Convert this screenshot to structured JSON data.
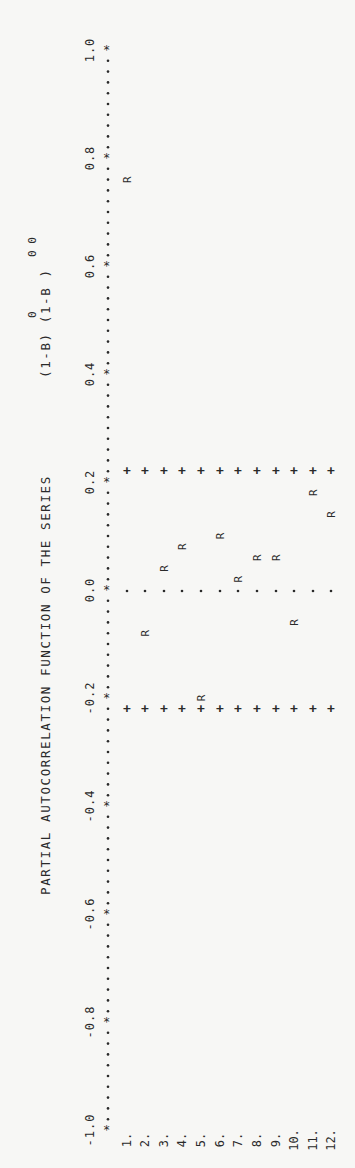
{
  "title": {
    "text": "PARTIAL AUTOCORRELATION FUNCTION OF THE SERIES",
    "formula": "(1-B) (1-B )",
    "superscript_first": "0",
    "superscript_second": "0 0"
  },
  "chart_data": {
    "type": "bar",
    "orientation": "rotated-90 (value axis vertical, reading bottom-to-top)",
    "xlabel": "Lag",
    "ylabel": "Partial autocorrelation",
    "categories": [
      "1.",
      "2.",
      "3.",
      "4.",
      "5.",
      "6.",
      "7.",
      "8.",
      "9.",
      "10.",
      "11.",
      "12."
    ],
    "series": [
      {
        "name": "PACF (R)",
        "marker": "R",
        "values": [
          0.76,
          -0.08,
          0.04,
          0.08,
          -0.2,
          0.1,
          0.02,
          0.06,
          0.06,
          -0.06,
          0.18,
          0.14
        ]
      }
    ],
    "confidence_bounds": {
      "upper": 0.22,
      "lower": -0.22,
      "marker": "+"
    },
    "zero_line_marker": ".",
    "ylim": [
      -1.0,
      1.0
    ],
    "tick_labels": [
      "-1.0",
      "-0.8",
      "-0.6",
      "-0.4",
      "-0.2",
      "0.0",
      "0.2",
      "0.4",
      "0.6",
      "0.8",
      "1.0"
    ],
    "ticks": [
      -1.0,
      -0.8,
      -0.6,
      -0.4,
      -0.2,
      0.0,
      0.2,
      0.4,
      0.6,
      0.8,
      1.0
    ],
    "axis_marker": "*",
    "grid": false,
    "legend": null
  },
  "layout": {
    "y_zero": 590,
    "px_per_unit": 540,
    "axis_x": 107,
    "label_x": 90,
    "title_x": 50,
    "lag_x": [
      127,
      145,
      164,
      182,
      201,
      220,
      238,
      257,
      276,
      294,
      313,
      331
    ],
    "lag_label_y": 1140,
    "ink": "#2a2a2a"
  }
}
